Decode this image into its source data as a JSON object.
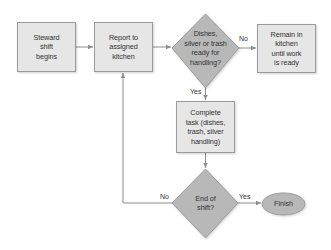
{
  "colors": {
    "box_fill": "#e6e6e6",
    "box_stroke": "#9a9a9a",
    "decision_fill": "#b8b8b8",
    "terminal_fill": "#b8b8b8",
    "line": "#8c8c8c",
    "text": "#333333"
  },
  "nodes": {
    "start": {
      "type": "process",
      "label": "Steward\nshift\nbegins"
    },
    "report": {
      "type": "process",
      "label": "Report to\nassigned\nkitchen"
    },
    "ready_check": {
      "type": "decision",
      "label": "Dishes,\nsilver or trash\nready for\nhandling?"
    },
    "remain": {
      "type": "process",
      "label": "Remain in\nkitchen\nuntil work\nis ready"
    },
    "complete": {
      "type": "process",
      "label": "Complete\ntask (dishes,\ntrash, silver\nhandling)"
    },
    "end_check": {
      "type": "decision",
      "label": "End of\nshift?"
    },
    "finish": {
      "type": "terminal",
      "label": "Finish"
    }
  },
  "edges": [
    {
      "from": "start",
      "to": "report",
      "label": ""
    },
    {
      "from": "report",
      "to": "ready_check",
      "label": ""
    },
    {
      "from": "ready_check",
      "to": "remain",
      "label": "No"
    },
    {
      "from": "ready_check",
      "to": "complete",
      "label": "Yes"
    },
    {
      "from": "complete",
      "to": "end_check",
      "label": ""
    },
    {
      "from": "end_check",
      "to": "finish",
      "label": "Yes"
    },
    {
      "from": "end_check",
      "to": "report",
      "label": "No"
    }
  ]
}
